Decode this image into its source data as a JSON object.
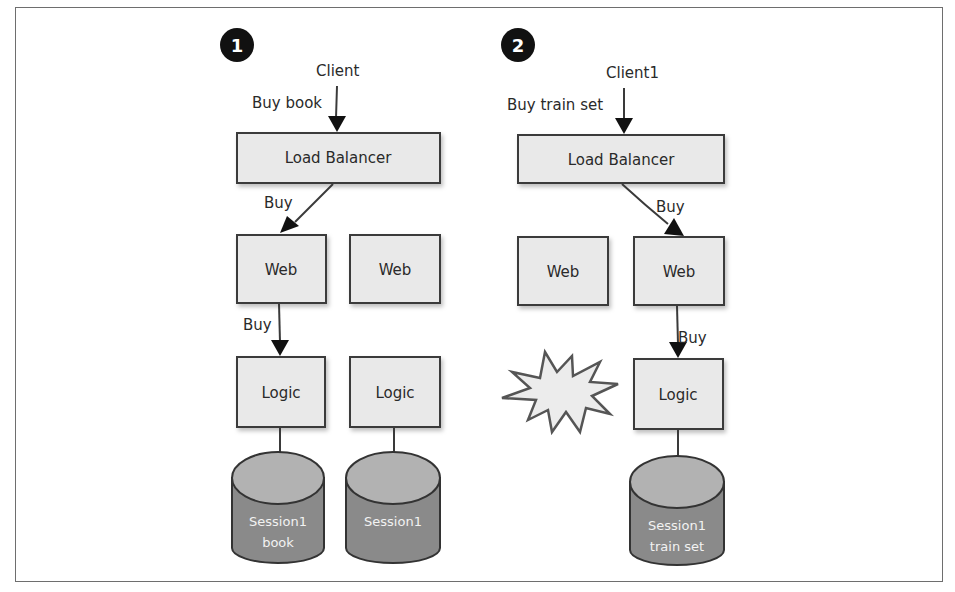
{
  "diagram": {
    "panels": [
      {
        "badge": "1",
        "client": "Client",
        "request": "Buy book",
        "load_balancer": "Load Balancer",
        "lb_to_web_label": "Buy",
        "web_servers": [
          "Web",
          "Web"
        ],
        "web_to_logic_label": "Buy",
        "logic_servers": [
          "Logic",
          "Logic"
        ],
        "sessions": [
          {
            "line1": "Session1",
            "line2": "book"
          },
          {
            "line1": "Session1",
            "line2": ""
          }
        ]
      },
      {
        "badge": "2",
        "client": "Client1",
        "request": "Buy train set",
        "load_balancer": "Load Balancer",
        "lb_to_web_label": "Buy",
        "web_servers": [
          "Web",
          "Web"
        ],
        "web_to_logic_label": "Buy",
        "logic_servers": [
          "Logic"
        ],
        "failed_node": "explosion-star",
        "sessions": [
          {
            "line1": "Session1",
            "line2": "train set"
          }
        ]
      }
    ],
    "colors": {
      "box_fill": "#e9e9e9",
      "box_stroke": "#3a3a3a",
      "cylinder_body": "#8a8a8a",
      "cylinder_top": "#b2b2b2",
      "badge": "#111111"
    }
  }
}
